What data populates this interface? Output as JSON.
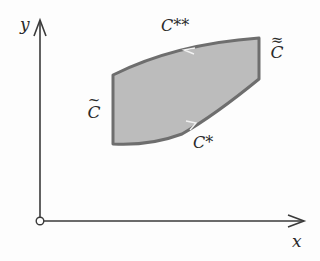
{
  "diagram": {
    "axes": {
      "x_label": "x",
      "y_label": "y",
      "origin_marker": "open-circle"
    },
    "region": {
      "fill_color": "#bcbcbc",
      "stroke_color": "#6e6e6e",
      "boundary_segments": [
        {
          "name": "C-tilde",
          "side": "left",
          "shape": "vertical line"
        },
        {
          "name": "C*",
          "side": "bottom",
          "shape": "curve",
          "arrow": "rightward"
        },
        {
          "name": "C-double-tilde",
          "side": "right",
          "shape": "vertical line"
        },
        {
          "name": "C**",
          "side": "top",
          "shape": "curve",
          "arrow": "leftward"
        }
      ]
    },
    "labels": {
      "c_star": "C*",
      "c_double_star": "C**",
      "c_tilde_letter": "C",
      "c_tilde_mark": "~",
      "c_double_tilde_letter": "C",
      "c_double_tilde_mark": "≈"
    }
  }
}
